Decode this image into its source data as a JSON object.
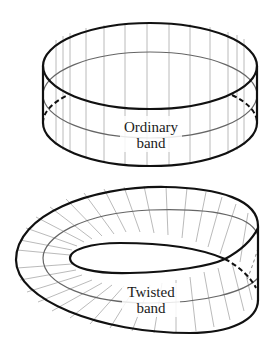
{
  "figure": {
    "background": "#ffffff",
    "line_color": "#111111",
    "rule_color": "#a8a8a8",
    "midline_color": "#666666"
  },
  "ordinary_band": {
    "label_line1": "Ordinary",
    "label_line2": "band"
  },
  "twisted_band": {
    "label_line1": "Twisted",
    "label_line2": "band"
  }
}
